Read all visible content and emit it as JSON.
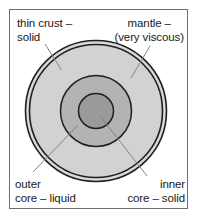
{
  "diagram": {
    "type": "concentric-cross-section",
    "frame": {
      "border_color": "#6e6e6e",
      "background_color": "#ffffff"
    },
    "layers": [
      {
        "id": "crust",
        "name": "thin crust",
        "state": "solid",
        "fill_color": "#d9d9d9",
        "stroke_color": "#1f1f1f",
        "radius_px": 71,
        "note": "thin double-line outer shell"
      },
      {
        "id": "mantle",
        "name": "mantle",
        "state": "very viscous",
        "fill_color": "#d2d2d2",
        "stroke_color": "#1f1f1f",
        "radius_px": 67
      },
      {
        "id": "outer-core",
        "name": "outer core",
        "state": "liquid",
        "fill_color": "#b3b3b3",
        "stroke_color": "#1f1f1f",
        "radius_px": 36
      },
      {
        "id": "inner-core",
        "name": "inner core",
        "state": "solid",
        "fill_color": "#9a9a9a",
        "stroke_color": "#1f1f1f",
        "radius_px": 18
      }
    ],
    "center": {
      "x": 96,
      "y": 111
    }
  },
  "labels": {
    "crust": {
      "line1": "thin crust –",
      "line2": "solid"
    },
    "mantle": {
      "line1": "mantle –",
      "line2": "(very viscous)"
    },
    "outer_core": {
      "line1": "outer",
      "line2": "core – liquid"
    },
    "inner_core": {
      "line1": "inner",
      "line2": "core – solid"
    }
  },
  "leader_lines": [
    {
      "id": "crust-leader",
      "x1": 45,
      "y1": 44,
      "x2": 61,
      "y2": 70
    },
    {
      "id": "mantle-leader",
      "x1": 150,
      "y1": 46,
      "x2": 131,
      "y2": 78
    },
    {
      "id": "outer-core-leader",
      "x1": 33,
      "y1": 172,
      "x2": 78,
      "y2": 125
    },
    {
      "id": "inner-core-leader",
      "x1": 147,
      "y1": 176,
      "x2": 100,
      "y2": 116
    }
  ],
  "colors": {
    "text": "#1a1a1a",
    "outline": "#1f1f1f",
    "leader": "#808080",
    "frame": "#6e6e6e"
  }
}
